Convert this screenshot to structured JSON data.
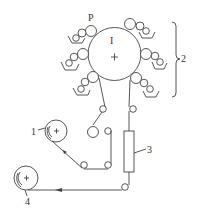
{
  "diagram": {
    "type": "web-fed printing press schematic (central impression cylinder)",
    "labels": {
      "impression_cylinder": "I",
      "plate_marker": "P",
      "unwind_roll": "1",
      "printing_units_group": "2",
      "dryer": "3",
      "rewind_roll": "4"
    },
    "components": [
      {
        "id": "1",
        "name": "unwind roll"
      },
      {
        "id": "2",
        "name": "printing units (6 around cylinder)"
      },
      {
        "id": "3",
        "name": "dryer"
      },
      {
        "id": "4",
        "name": "rewind roll"
      },
      {
        "id": "I",
        "name": "central impression cylinder"
      },
      {
        "id": "P",
        "name": "plate cylinder"
      }
    ],
    "colors": {
      "line": "#444444",
      "background": "#ffffff"
    }
  }
}
